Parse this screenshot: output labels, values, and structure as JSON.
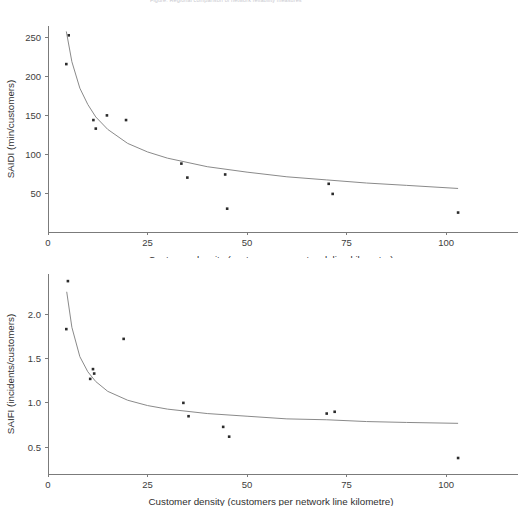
{
  "header": {
    "caption": "Figure: Regional comparison of network reliability measures"
  },
  "charts": [
    {
      "id": "saidi",
      "ylabel": "SAIDI (min/customers)",
      "xlabel": "Customer density (customers per network line kilometre)",
      "xticks": [
        "0",
        "25",
        "50",
        "75",
        "100"
      ],
      "yticks": [
        "50",
        "100",
        "150",
        "200",
        "250"
      ]
    },
    {
      "id": "saifi",
      "ylabel": "SAIFI (incidents/customers)",
      "xlabel": "Customer density (customers per network line kilometre)",
      "xticks": [
        "0",
        "25",
        "50",
        "75",
        "100"
      ],
      "yticks": [
        "0.5",
        "1.0",
        "1.5",
        "2.0"
      ]
    }
  ],
  "chart_data": [
    {
      "type": "scatter",
      "title": "",
      "xlabel": "Customer density (customers per network line kilometre)",
      "ylabel": "SAIDI (min/customers)",
      "xlim": [
        0,
        108
      ],
      "ylim": [
        0,
        265
      ],
      "xticks": [
        0,
        25,
        50,
        75,
        100
      ],
      "yticks": [
        50,
        100,
        150,
        200,
        250
      ],
      "grid": false,
      "legend": "none",
      "series": [
        {
          "name": "Network SAIDI observations",
          "marker": "point",
          "color": "#2b2b2b",
          "points": [
            {
              "x": 5.2,
              "y": 253
            },
            {
              "x": 4.6,
              "y": 216
            },
            {
              "x": 11.4,
              "y": 144
            },
            {
              "x": 12.0,
              "y": 133
            },
            {
              "x": 14.8,
              "y": 150
            },
            {
              "x": 19.6,
              "y": 144
            },
            {
              "x": 33.5,
              "y": 88
            },
            {
              "x": 35.0,
              "y": 70
            },
            {
              "x": 44.5,
              "y": 74
            },
            {
              "x": 45.0,
              "y": 30
            },
            {
              "x": 70.5,
              "y": 62
            },
            {
              "x": 71.5,
              "y": 49
            },
            {
              "x": 103.0,
              "y": 25
            }
          ]
        },
        {
          "name": "Fitted power curve",
          "type": "line",
          "color": "#8a8a8a",
          "points": [
            {
              "x": 4.6,
              "y": 258
            },
            {
              "x": 6,
              "y": 219
            },
            {
              "x": 8,
              "y": 185
            },
            {
              "x": 10,
              "y": 164
            },
            {
              "x": 12,
              "y": 148
            },
            {
              "x": 15,
              "y": 132
            },
            {
              "x": 20,
              "y": 114
            },
            {
              "x": 25,
              "y": 103
            },
            {
              "x": 30,
              "y": 95
            },
            {
              "x": 40,
              "y": 84
            },
            {
              "x": 50,
              "y": 77
            },
            {
              "x": 60,
              "y": 71
            },
            {
              "x": 70,
              "y": 67
            },
            {
              "x": 80,
              "y": 63
            },
            {
              "x": 90,
              "y": 60
            },
            {
              "x": 103,
              "y": 56
            }
          ]
        }
      ]
    },
    {
      "type": "scatter",
      "title": "",
      "xlabel": "Customer density (customers per network line kilometre)",
      "ylabel": "SAIFI (incidents/customers)",
      "xlim": [
        0,
        108
      ],
      "ylim": [
        0.2,
        2.45
      ],
      "xticks": [
        0,
        25,
        50,
        75,
        100
      ],
      "yticks": [
        0.5,
        1.0,
        1.5,
        2.0
      ],
      "grid": false,
      "legend": "none",
      "series": [
        {
          "name": "Network SAIFI observations",
          "marker": "point",
          "color": "#2b2b2b",
          "points": [
            {
              "x": 5.0,
              "y": 2.37
            },
            {
              "x": 4.6,
              "y": 1.83
            },
            {
              "x": 11.3,
              "y": 1.38
            },
            {
              "x": 11.6,
              "y": 1.33
            },
            {
              "x": 10.6,
              "y": 1.27
            },
            {
              "x": 19.0,
              "y": 1.72
            },
            {
              "x": 34.0,
              "y": 1.0
            },
            {
              "x": 35.3,
              "y": 0.85
            },
            {
              "x": 44.0,
              "y": 0.73
            },
            {
              "x": 45.5,
              "y": 0.62
            },
            {
              "x": 70.0,
              "y": 0.88
            },
            {
              "x": 72.0,
              "y": 0.9
            },
            {
              "x": 103.0,
              "y": 0.38
            }
          ]
        },
        {
          "name": "Fitted power curve",
          "type": "line",
          "color": "#8a8a8a",
          "points": [
            {
              "x": 4.7,
              "y": 2.25
            },
            {
              "x": 6,
              "y": 1.85
            },
            {
              "x": 8,
              "y": 1.52
            },
            {
              "x": 10,
              "y": 1.35
            },
            {
              "x": 12,
              "y": 1.24
            },
            {
              "x": 15,
              "y": 1.13
            },
            {
              "x": 20,
              "y": 1.03
            },
            {
              "x": 25,
              "y": 0.97
            },
            {
              "x": 30,
              "y": 0.93
            },
            {
              "x": 40,
              "y": 0.88
            },
            {
              "x": 50,
              "y": 0.85
            },
            {
              "x": 60,
              "y": 0.82
            },
            {
              "x": 70,
              "y": 0.81
            },
            {
              "x": 80,
              "y": 0.79
            },
            {
              "x": 90,
              "y": 0.78
            },
            {
              "x": 103,
              "y": 0.77
            }
          ]
        }
      ]
    }
  ]
}
